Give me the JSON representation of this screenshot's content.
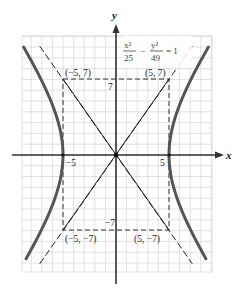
{
  "figure": {
    "equation": {
      "x_numerator": "x²",
      "x_denominator": "25",
      "minus": "−",
      "y_numerator": "y²",
      "y_denominator": "49",
      "rhs": "= 1"
    },
    "axes": {
      "x_label": "x",
      "y_label": "y"
    },
    "tick_labels": {
      "x_neg": "−5",
      "x_pos": "5",
      "y_pos": "7",
      "y_neg": "−7"
    },
    "point_labels": {
      "top_left": "(−5, 7)",
      "top_right": "(5, 7)",
      "bottom_left": "(−5, −7)",
      "bottom_right": "(5, −7)"
    },
    "parameters": {
      "a": 5,
      "b": 7
    },
    "asymptotes": [
      "y = (7/5)x",
      "y = −(7/5)x"
    ],
    "colors": {
      "grid": "#d4d4d4",
      "axis": "#333333",
      "hyperbola": "#555555",
      "dashed": "#333333",
      "asymptote": "#222222"
    }
  }
}
